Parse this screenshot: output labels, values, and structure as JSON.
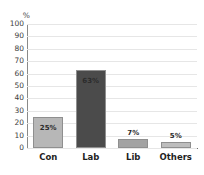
{
  "chart_data": {
    "type": "bar",
    "title": "",
    "xlabel": "",
    "ylabel": "%",
    "categories": [
      "Con",
      "Lab",
      "Lib",
      "Others"
    ],
    "values": [
      25,
      63,
      7,
      5
    ],
    "value_labels": [
      "25%",
      "63%",
      "7%",
      "5%"
    ],
    "label_positions": [
      "inside",
      "inside",
      "above",
      "above"
    ],
    "bar_colors": [
      "#b7b7b7",
      "#4b4b4b",
      "#a3a3a3",
      "#bdbdbd"
    ],
    "bar_border_color": "#8f8f8f",
    "ylim": [
      0,
      100
    ],
    "ytick_labels": [
      "100",
      "90",
      "80",
      "70",
      "60",
      "50",
      "40",
      "30",
      "20",
      "10",
      "0"
    ],
    "ytick_values": [
      100,
      90,
      80,
      70,
      60,
      50,
      40,
      30,
      20,
      10,
      0
    ],
    "grid": true,
    "legend": false,
    "background_color": "#ffffff"
  }
}
